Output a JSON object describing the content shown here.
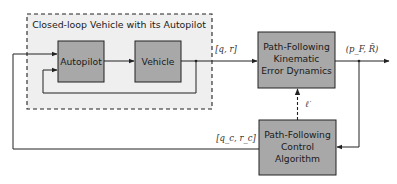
{
  "diagram": {
    "group": {
      "title": "Closed-loop Vehicle with its Autopilot"
    },
    "blocks": {
      "autopilot": {
        "label": "Autopilot"
      },
      "vehicle": {
        "label": "Vehicle"
      },
      "kinematic": {
        "lines": [
          "Path-Following",
          "Kinematic",
          "Error Dynamics"
        ]
      },
      "control": {
        "lines": [
          "Path-Following",
          "Control",
          "Algorithm"
        ]
      }
    },
    "signals": {
      "vehicle_state": "[q, r]",
      "output": "(p_F, R̃)",
      "error": "ℓ̇",
      "commands": "[q_c, r_c]"
    },
    "colors": {
      "block_fill": "#a8a8a8",
      "group_fill": "#efefef",
      "line": "#333333"
    }
  }
}
